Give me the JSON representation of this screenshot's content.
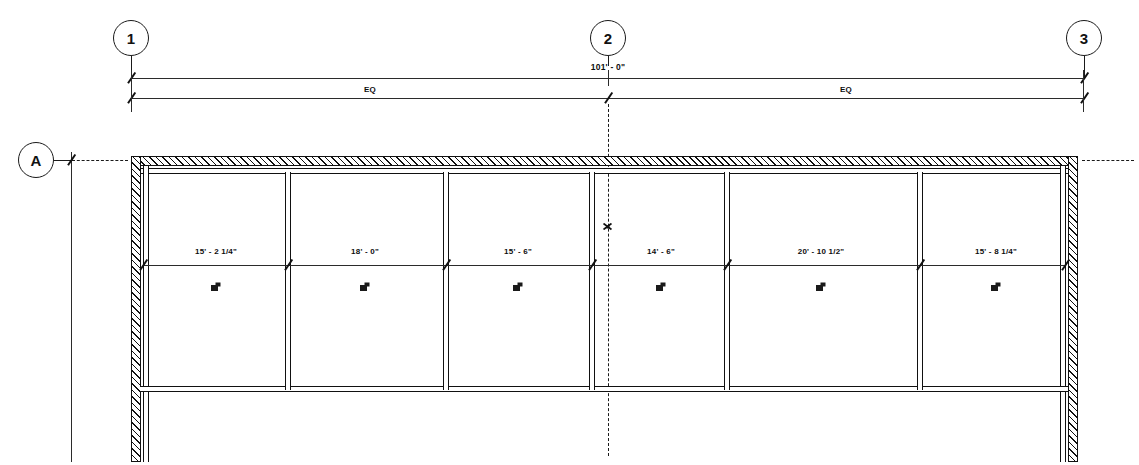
{
  "drawing": {
    "title": "Partial Floor Plan",
    "overall_dimension": "101' - 0\"",
    "eq_label_left": "EQ",
    "eq_label_right": "EQ"
  },
  "grid_bubbles": [
    {
      "id": "grid-1",
      "label": "1",
      "x": 131,
      "y": 38,
      "axis": "vertical"
    },
    {
      "id": "grid-2",
      "label": "2",
      "x": 608,
      "y": 38,
      "axis": "vertical"
    },
    {
      "id": "grid-3",
      "label": "3",
      "x": 1084,
      "y": 38,
      "axis": "vertical"
    },
    {
      "id": "grid-A",
      "label": "A",
      "x": 36,
      "y": 160,
      "axis": "horizontal"
    }
  ],
  "dimension_strings": [
    {
      "name": "overall-eq-string",
      "y": 98,
      "segments": [
        {
          "label": "EQ",
          "x_start": 131,
          "x_end": 608
        },
        {
          "label": "EQ",
          "x_start": 608,
          "x_end": 1084
        }
      ]
    },
    {
      "name": "overall-total-string",
      "y": 78,
      "segments": [
        {
          "label": "101' - 0\"",
          "x_start": 131,
          "x_end": 1084
        }
      ]
    }
  ],
  "bays": [
    {
      "name": "bay-1",
      "dimension": "15' - 2 1/4\"",
      "x_start": 140,
      "x_end": 288,
      "center": 216
    },
    {
      "name": "bay-2",
      "dimension": "18' - 0\"",
      "x_start": 288,
      "x_end": 446,
      "center": 365
    },
    {
      "name": "bay-3",
      "dimension": "15' - 6\"",
      "x_start": 446,
      "x_end": 592,
      "center": 518
    },
    {
      "name": "bay-4",
      "dimension": "14' - 6\"",
      "x_start": 592,
      "x_end": 727,
      "center": 661
    },
    {
      "name": "bay-5",
      "dimension": "20' - 10 1/2\"",
      "x_start": 727,
      "x_end": 920,
      "center": 821
    },
    {
      "name": "bay-6",
      "dimension": "15' - 8 1/4\"",
      "x_start": 920,
      "x_end": 1068,
      "center": 996
    }
  ],
  "room_dim_y": 253,
  "room_tag_y": 280,
  "plan": {
    "top_wall_y": 160,
    "interior_dim_line_y": 265,
    "bottom_wall_y": 390,
    "left_wall_x": 131,
    "right_wall_x": 1077,
    "wall_thickness": 13,
    "partition_thickness": 6
  },
  "colors": {
    "line": "#111111",
    "paper": "#ffffff",
    "dim_line": "#2b2b2b"
  },
  "icons": {
    "grid_bubble": "circle-grid-bubble",
    "dimension_tick": "slash-tick-icon",
    "room_tag": "room-tag-icon",
    "centerline_symbol": "centerline-symbol-icon"
  }
}
